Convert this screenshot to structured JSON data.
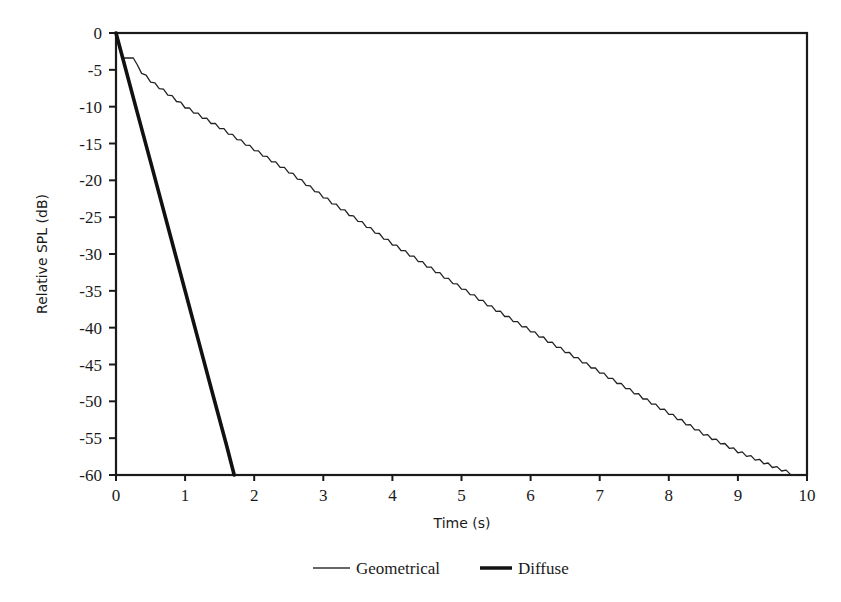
{
  "chart_data": {
    "type": "line",
    "title": "",
    "xlabel": "Time (s)",
    "ylabel": "Relative SPL (dB)",
    "xlim": [
      0,
      10
    ],
    "ylim": [
      -60,
      0
    ],
    "xticks": [
      0,
      1,
      2,
      3,
      4,
      5,
      6,
      7,
      8,
      9,
      10
    ],
    "yticks": [
      0,
      -5,
      -10,
      -15,
      -20,
      -25,
      -30,
      -35,
      -40,
      -45,
      -50,
      -55,
      -60
    ],
    "grid": false,
    "legend_position": "bottom",
    "series": [
      {
        "name": "Geometrical",
        "style": "thin",
        "color": "#222222",
        "x": [
          0,
          0.09,
          0.25,
          0.37,
          0.5,
          1.0,
          1.5,
          2.0,
          2.5,
          3.0,
          3.5,
          4.0,
          4.5,
          5.0,
          5.5,
          6.0,
          6.5,
          7.0,
          7.5,
          8.0,
          8.5,
          9.0,
          9.5,
          9.83
        ],
        "y": [
          0,
          -3.4,
          -3.4,
          -5.3,
          -6.5,
          -10.0,
          -12.8,
          -15.8,
          -18.8,
          -22.2,
          -25.4,
          -28.6,
          -31.6,
          -34.6,
          -37.6,
          -40.4,
          -43.2,
          -46.0,
          -48.8,
          -51.6,
          -54.4,
          -56.8,
          -58.8,
          -60
        ]
      },
      {
        "name": "Diffuse",
        "style": "thick",
        "color": "#111111",
        "x": [
          0,
          0.1,
          0.3,
          0.5,
          0.8,
          1.0,
          1.2,
          1.4,
          1.6,
          1.71
        ],
        "y": [
          0,
          -3.5,
          -10.5,
          -17.5,
          -28.0,
          -35.0,
          -42.0,
          -49.0,
          -56.0,
          -60
        ]
      }
    ]
  },
  "legend": {
    "items": [
      {
        "label": "Geometrical",
        "style": "thin"
      },
      {
        "label": "Diffuse",
        "style": "thick"
      }
    ]
  }
}
